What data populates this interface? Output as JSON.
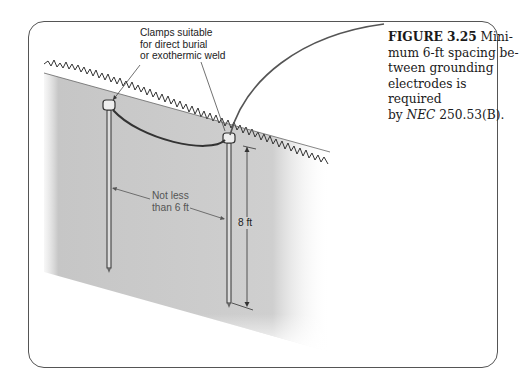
{
  "figure": {
    "label": "FIGURE 3.25",
    "caption_lines": [
      "Mini-",
      "mum 6-ft spacing be-",
      "tween grounding",
      "electrodes is required",
      "by "
    ],
    "caption_nec": "NEC",
    "caption_ref": " 250.53(B).",
    "callouts": {
      "clamps": [
        "Clamps suitable",
        "for direct burial",
        "or exothermic weld"
      ],
      "spacing": [
        "Not less",
        "than 6 ft"
      ],
      "depth": "8 ft"
    }
  }
}
